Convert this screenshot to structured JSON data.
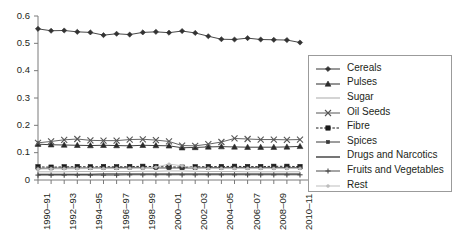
{
  "chart_data": {
    "type": "line",
    "title": "",
    "xlabel": "",
    "ylabel": "",
    "ylim": [
      0,
      0.6
    ],
    "y_ticks": [
      "0",
      "0.1",
      "0.2",
      "0.3",
      "0.4",
      "0.5",
      "0.6"
    ],
    "y_tick_values": [
      0,
      0.1,
      0.2,
      0.3,
      0.4,
      0.5,
      0.6
    ],
    "grid": false,
    "legend_position": "right-inside",
    "x": [
      "1990-91",
      "1991-92",
      "1992-93",
      "1993-94",
      "1994-95",
      "1995-96",
      "1996-97",
      "1997-98",
      "1998-99",
      "1999-2000",
      "2000-01",
      "2001-02",
      "2002-03",
      "2003-04",
      "2004-05",
      "2005-06",
      "2006-07",
      "2007-08",
      "2008-09",
      "2009-10",
      "2010-11"
    ],
    "x_tick_labels": [
      "1990–91",
      "",
      "1992–93",
      "",
      "1994–95",
      "",
      "1996–97",
      "",
      "1998–99",
      "",
      "2000–01",
      "",
      "2002–03",
      "",
      "2004–05",
      "",
      "2006–07",
      "",
      "2008–09",
      "",
      "2010–11"
    ],
    "series": [
      {
        "name": "Cereals",
        "marker": "diamond",
        "color": "#333333",
        "dash": "solid",
        "values": [
          0.553,
          0.546,
          0.547,
          0.542,
          0.54,
          0.53,
          0.535,
          0.532,
          0.54,
          0.542,
          0.539,
          0.545,
          0.538,
          0.526,
          0.515,
          0.514,
          0.519,
          0.514,
          0.513,
          0.512,
          0.503
        ]
      },
      {
        "name": "Pulses",
        "marker": "triangle",
        "color": "#2b2b2b",
        "dash": "solid",
        "values": [
          0.131,
          0.129,
          0.128,
          0.127,
          0.126,
          0.127,
          0.126,
          0.125,
          0.127,
          0.126,
          0.125,
          0.118,
          0.119,
          0.121,
          0.122,
          0.121,
          0.12,
          0.12,
          0.12,
          0.121,
          0.123
        ]
      },
      {
        "name": "Sugar",
        "marker": "none",
        "color": "#b7b7b7",
        "dash": "solid",
        "values": [
          0.03,
          0.03,
          0.03,
          0.031,
          0.031,
          0.031,
          0.031,
          0.031,
          0.032,
          0.032,
          0.033,
          0.033,
          0.032,
          0.031,
          0.031,
          0.031,
          0.03,
          0.03,
          0.03,
          0.03,
          0.03
        ]
      },
      {
        "name": "Oil Seeds",
        "marker": "cross-x",
        "color": "#555555",
        "dash": "solid",
        "values": [
          0.136,
          0.141,
          0.147,
          0.15,
          0.145,
          0.144,
          0.144,
          0.148,
          0.149,
          0.146,
          0.141,
          0.126,
          0.125,
          0.131,
          0.139,
          0.152,
          0.15,
          0.148,
          0.148,
          0.147,
          0.148
        ]
      },
      {
        "name": "Fibre",
        "marker": "square",
        "color": "#1a1a1a",
        "dash": "dotted",
        "values": [
          0.048,
          0.047,
          0.048,
          0.049,
          0.048,
          0.049,
          0.048,
          0.049,
          0.05,
          0.049,
          0.048,
          0.047,
          0.048,
          0.049,
          0.049,
          0.05,
          0.049,
          0.049,
          0.05,
          0.05,
          0.049
        ]
      },
      {
        "name": "Spices",
        "marker": "square-small",
        "color": "#3a3a3a",
        "dash": "solid",
        "values": [
          0.043,
          0.043,
          0.044,
          0.044,
          0.044,
          0.044,
          0.045,
          0.045,
          0.045,
          0.044,
          0.044,
          0.044,
          0.044,
          0.045,
          0.045,
          0.045,
          0.045,
          0.045,
          0.045,
          0.045,
          0.045
        ]
      },
      {
        "name": "Drugs and Narcotics",
        "marker": "none",
        "color": "#1a1a1a",
        "dash": "solid",
        "values": [
          0.021,
          0.021,
          0.021,
          0.021,
          0.021,
          0.022,
          0.022,
          0.022,
          0.022,
          0.022,
          0.022,
          0.022,
          0.022,
          0.022,
          0.022,
          0.022,
          0.022,
          0.022,
          0.022,
          0.022,
          0.022
        ]
      },
      {
        "name": "Fruits and Vegetables",
        "marker": "plus",
        "color": "#4a4a4a",
        "dash": "solid",
        "values": [
          0.018,
          0.018,
          0.018,
          0.018,
          0.018,
          0.018,
          0.018,
          0.019,
          0.019,
          0.019,
          0.019,
          0.019,
          0.019,
          0.019,
          0.019,
          0.019,
          0.019,
          0.019,
          0.019,
          0.019,
          0.019
        ]
      },
      {
        "name": "Rest",
        "marker": "dot-light",
        "color": "#bdbdbd",
        "dash": "solid",
        "values": [
          0.04,
          0.041,
          0.041,
          0.041,
          0.042,
          0.042,
          0.042,
          0.043,
          0.043,
          0.047,
          0.058,
          0.052,
          0.043,
          0.042,
          0.042,
          0.042,
          0.042,
          0.042,
          0.042,
          0.042,
          0.042
        ]
      }
    ]
  },
  "legend": {
    "items": [
      {
        "label": "Cereals"
      },
      {
        "label": "Pulses"
      },
      {
        "label": "Sugar"
      },
      {
        "label": "Oil Seeds"
      },
      {
        "label": "Fibre"
      },
      {
        "label": "Spices"
      },
      {
        "label": "Drugs and Narcotics"
      },
      {
        "label": "Fruits and Vegetables"
      },
      {
        "label": "Rest"
      }
    ]
  }
}
